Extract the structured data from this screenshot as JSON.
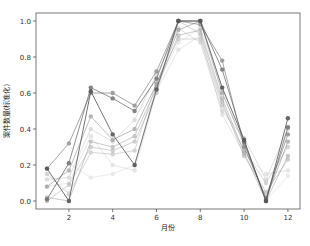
{
  "chart_data": {
    "type": "line",
    "title": "",
    "xlabel": "月份",
    "ylabel": "案件数量(标准化)",
    "x": [
      1,
      2,
      3,
      4,
      5,
      6,
      7,
      8,
      9,
      10,
      11,
      12
    ],
    "xticks": [
      2,
      4,
      6,
      8,
      10,
      12
    ],
    "yticks": [
      0.0,
      0.2,
      0.4,
      0.6,
      0.8,
      1.0
    ],
    "ytick_labels": [
      "0.0",
      "0.2",
      "0.4",
      "0.6",
      "0.8",
      "1.0"
    ],
    "xlim": [
      0.5,
      12.5
    ],
    "ylim": [
      -0.03,
      1.03
    ],
    "grid": false,
    "legend": "none",
    "series": [
      {
        "name": "series-1",
        "color": "#555555",
        "alpha": 0.9,
        "values": [
          0.18,
          0.0,
          0.61,
          0.37,
          0.2,
          0.62,
          1.0,
          1.0,
          0.63,
          0.34,
          0.0,
          0.46
        ]
      },
      {
        "name": "series-2",
        "color": "#666666",
        "alpha": 0.8,
        "values": [
          0.01,
          0.21,
          0.63,
          0.57,
          0.5,
          0.68,
          1.0,
          1.0,
          0.73,
          0.33,
          0.0,
          0.41
        ]
      },
      {
        "name": "series-3",
        "color": "#777777",
        "alpha": 0.7,
        "values": [
          0.18,
          0.32,
          0.6,
          0.6,
          0.53,
          0.72,
          1.0,
          0.98,
          0.78,
          0.3,
          0.02,
          0.37
        ]
      },
      {
        "name": "series-4",
        "color": "#888888",
        "alpha": 0.6,
        "values": [
          0.08,
          0.17,
          0.47,
          0.34,
          0.4,
          0.65,
          0.95,
          1.0,
          0.6,
          0.32,
          0.01,
          0.33
        ]
      },
      {
        "name": "series-5",
        "color": "#999999",
        "alpha": 0.55,
        "values": [
          0.02,
          0.0,
          0.33,
          0.3,
          0.36,
          0.63,
          0.92,
          0.95,
          0.57,
          0.27,
          0.0,
          0.25
        ]
      },
      {
        "name": "series-6",
        "color": "#a0a0a0",
        "alpha": 0.5,
        "values": [
          0.0,
          0.09,
          0.3,
          0.28,
          0.33,
          0.6,
          1.0,
          0.93,
          0.55,
          0.25,
          0.05,
          0.23
        ]
      },
      {
        "name": "series-7",
        "color": "#aaaaaa",
        "alpha": 0.5,
        "values": [
          0.15,
          0.04,
          0.27,
          0.26,
          0.28,
          0.66,
          0.9,
          0.9,
          0.53,
          0.28,
          0.1,
          0.3
        ]
      },
      {
        "name": "series-8",
        "color": "#b4b4b4",
        "alpha": 0.45,
        "values": [
          0.12,
          0.13,
          0.4,
          0.33,
          0.45,
          0.7,
          0.96,
          0.88,
          0.5,
          0.35,
          0.12,
          0.4
        ]
      },
      {
        "name": "series-9",
        "color": "#c0c0c0",
        "alpha": 0.4,
        "values": [
          0.08,
          0.1,
          0.36,
          0.2,
          0.17,
          0.61,
          0.84,
          0.92,
          0.48,
          0.26,
          0.15,
          0.17
        ]
      },
      {
        "name": "series-10",
        "color": "#cccccc",
        "alpha": 0.4,
        "values": [
          0.0,
          0.21,
          0.13,
          0.15,
          0.2,
          0.64,
          0.88,
          0.96,
          0.62,
          0.3,
          0.0,
          0.14
        ]
      }
    ]
  },
  "layout": {
    "plot_left": 36,
    "plot_top": 13,
    "plot_right": 300,
    "plot_bottom": 209,
    "x_at_1": 47,
    "px_per_month": 21.9,
    "y_at_0": 201,
    "px_per_unit": 180
  }
}
